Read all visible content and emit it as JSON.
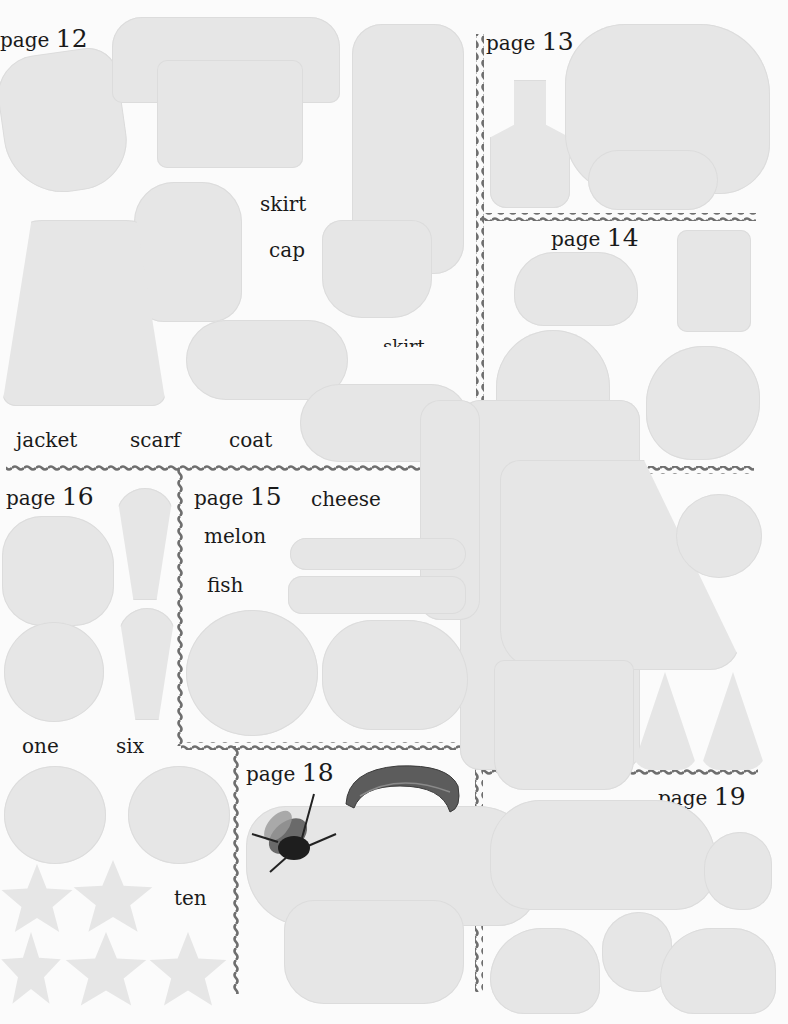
{
  "sheet": {
    "title": "Sticker sheet",
    "pages": [
      {
        "id": "page12",
        "prefix": "page",
        "number": "12"
      },
      {
        "id": "page13",
        "prefix": "page",
        "number": "13"
      },
      {
        "id": "page14",
        "prefix": "page",
        "number": "14"
      },
      {
        "id": "page15",
        "prefix": "page",
        "number": "15"
      },
      {
        "id": "page16",
        "prefix": "page",
        "number": "16"
      },
      {
        "id": "page18",
        "prefix": "page",
        "number": "18"
      },
      {
        "id": "page19",
        "prefix": "page",
        "number": "19"
      }
    ],
    "words": {
      "skirt": "skirt",
      "cap": "cap",
      "skirt_partial": "skirt",
      "jacket": "jacket",
      "scarf": "scarf",
      "coat": "coat",
      "cheese": "cheese",
      "melon": "melon",
      "fish": "fish",
      "one": "one",
      "six": "six",
      "ten": "ten"
    },
    "colors": {
      "background": "#fbfbfb",
      "sticker": "#e6e6e6",
      "divider": "#6e6e6e",
      "text": "#1a1a1a"
    },
    "images": {
      "bee": "bee-sticker",
      "caterpillar": "caterpillar-sticker"
    }
  }
}
